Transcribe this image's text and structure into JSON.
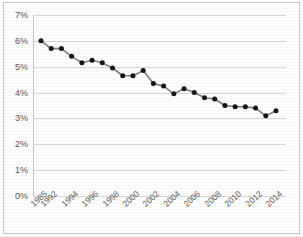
{
  "figure": {
    "title_cut_off": "",
    "background": "#ffffff",
    "border_color": "#c9c9c9",
    "grid_color": "#d6d6d6",
    "line_color": "#808080",
    "marker_color": "#151515"
  },
  "axis": {
    "y_ticks": [
      "7%",
      "6%",
      "5%",
      "4%",
      "3%",
      "2%",
      "1%",
      "0%"
    ],
    "x_ticks": [
      "1985",
      "1992",
      "1994",
      "1996",
      "1998",
      "2000",
      "2002",
      "2004",
      "2006",
      "2008",
      "2010",
      "2012",
      "2014"
    ]
  },
  "chart_data": {
    "type": "line",
    "title": "",
    "xlabel": "",
    "ylabel": "",
    "ylim": [
      0,
      7
    ],
    "yunit": "%",
    "ytick_values": [
      0,
      1,
      2,
      3,
      4,
      5,
      6,
      7
    ],
    "grid": true,
    "legend": "none",
    "marker": "circle",
    "x": [
      1985,
      1992,
      1993,
      1994,
      1995,
      1996,
      1997,
      1998,
      1999,
      2000,
      2001,
      2002,
      2003,
      2004,
      2005,
      2006,
      2007,
      2008,
      2009,
      2010,
      2011,
      2012,
      2013,
      2014
    ],
    "xtick_labels": [
      "1985",
      "1992",
      "1994",
      "1996",
      "1998",
      "2000",
      "2002",
      "2004",
      "2006",
      "2008",
      "2010",
      "2012",
      "2014"
    ],
    "values": [
      6.0,
      5.7,
      5.7,
      5.4,
      5.15,
      5.25,
      5.15,
      4.95,
      4.65,
      4.65,
      4.85,
      4.35,
      4.25,
      3.95,
      4.15,
      4.0,
      3.8,
      3.75,
      3.5,
      3.45,
      3.45,
      3.4,
      3.1,
      3.3
    ],
    "series": [
      {
        "name": "rate",
        "points": [
          {
            "x": "1985",
            "y": 6.0
          },
          {
            "x": "1992",
            "y": 5.7
          },
          {
            "x": "1993",
            "y": 5.7
          },
          {
            "x": "1994",
            "y": 5.4
          },
          {
            "x": "1995",
            "y": 5.15
          },
          {
            "x": "1996",
            "y": 5.25
          },
          {
            "x": "1997",
            "y": 5.15
          },
          {
            "x": "1998",
            "y": 4.95
          },
          {
            "x": "1999",
            "y": 4.65
          },
          {
            "x": "2000",
            "y": 4.65
          },
          {
            "x": "2001",
            "y": 4.85
          },
          {
            "x": "2002",
            "y": 4.35
          },
          {
            "x": "2003",
            "y": 4.25
          },
          {
            "x": "2004",
            "y": 3.95
          },
          {
            "x": "2005",
            "y": 4.15
          },
          {
            "x": "2006",
            "y": 4.0
          },
          {
            "x": "2007",
            "y": 3.8
          },
          {
            "x": "2008",
            "y": 3.75
          },
          {
            "x": "2009",
            "y": 3.5
          },
          {
            "x": "2010",
            "y": 3.45
          },
          {
            "x": "2011",
            "y": 3.45
          },
          {
            "x": "2012",
            "y": 3.4
          },
          {
            "x": "2013",
            "y": 3.1
          },
          {
            "x": "2014",
            "y": 3.3
          }
        ]
      }
    ]
  }
}
